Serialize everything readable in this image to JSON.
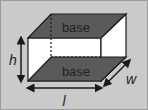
{
  "diagram": {
    "labels": {
      "top_base": "base",
      "bottom_base": "base",
      "height": "h",
      "width": "w",
      "length": "l"
    },
    "colors": {
      "background": "#cacaca",
      "base_fill": "#5a5a5a",
      "side_fill": "#ffffff",
      "edge": "#1a1a1a",
      "text": "#222222"
    }
  }
}
